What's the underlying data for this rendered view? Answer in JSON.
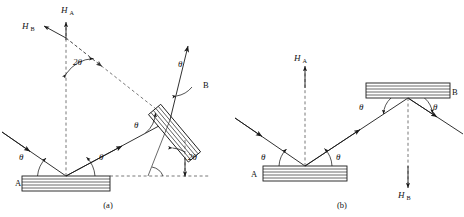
{
  "figure": {
    "panels": [
      {
        "id": "a",
        "caption": "(a)",
        "caption_x": 108,
        "caption_y": 207,
        "arrangement": "non-parallel (+,+) setting",
        "crystals": [
          {
            "name": "A",
            "label": "A",
            "label_x": 15,
            "label_y": 186,
            "tilt_deg": 0
          },
          {
            "name": "B",
            "label": "B",
            "label_x": 203,
            "label_y": 88,
            "tilt_deg": 50
          }
        ],
        "normals": [
          {
            "name": "H_A",
            "base": "H",
            "sub": "A",
            "label_x": 66,
            "label_y": 11,
            "direction": "up"
          },
          {
            "name": "H_B",
            "base": "H",
            "sub": "B",
            "label_x": 26,
            "label_y": 27,
            "direction": "up-left"
          }
        ],
        "angles": [
          {
            "name": "theta-incident-A",
            "label": "θ",
            "x": 22,
            "y": 157
          },
          {
            "name": "theta-exit-A",
            "label": "θ",
            "x": 100,
            "y": 157
          },
          {
            "name": "theta-at-B",
            "label": "θ",
            "x": 136,
            "y": 125
          },
          {
            "name": "theta-normal-B",
            "label": "θ",
            "x": 180,
            "y": 66
          },
          {
            "name": "two-theta-top",
            "label": "2θ",
            "x": 77,
            "y": 62
          },
          {
            "name": "two-theta-bottom",
            "label": "2θ",
            "x": 178,
            "y": 163
          }
        ]
      },
      {
        "id": "b",
        "caption": "(b)",
        "caption_x": 342,
        "caption_y": 207,
        "arrangement": "parallel (+,−) setting",
        "crystals": [
          {
            "name": "A",
            "label": "A",
            "label_x": 251,
            "label_y": 177,
            "tilt_deg": 0
          },
          {
            "name": "B",
            "label": "B",
            "label_x": 452,
            "label_y": 92,
            "tilt_deg": 0
          }
        ],
        "normals": [
          {
            "name": "H_A",
            "base": "H",
            "sub": "A",
            "label_x": 295,
            "label_y": 61,
            "direction": "up"
          },
          {
            "name": "H_B",
            "base": "H",
            "sub": "B",
            "label_x": 405,
            "label_y": 192,
            "direction": "down"
          }
        ],
        "angles": [
          {
            "name": "theta-incident-A",
            "label": "θ",
            "x": 263,
            "y": 157
          },
          {
            "name": "theta-exit-A",
            "label": "θ",
            "x": 337,
            "y": 157
          },
          {
            "name": "theta-incident-B",
            "label": "θ",
            "x": 362,
            "y": 107
          },
          {
            "name": "theta-exit-B",
            "label": "θ",
            "x": 422,
            "y": 108
          }
        ]
      }
    ],
    "symbols": {
      "theta": "θ",
      "two_theta": "2θ",
      "normal_letter": "H"
    },
    "colors": {
      "ink": "#1a1a1a",
      "dashed": "#555555",
      "background": "#ffffff"
    },
    "legend_note": {
      "solid_arrows": "X-ray beam paths",
      "dashed_arrows": "reciprocal lattice vectors / reference directions",
      "slabs": "layered crystal plates"
    }
  }
}
